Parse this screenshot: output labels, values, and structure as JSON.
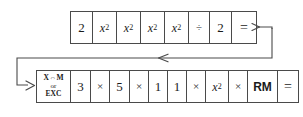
{
  "diagram": {
    "line_color": "#4a4a4a",
    "background_color": "#ffffff",
    "rows": [
      {
        "name": "top-sequence",
        "keys": [
          {
            "label": "2",
            "style": "num"
          },
          {
            "label": "x2",
            "style": "sq",
            "base": "x",
            "exp": "2"
          },
          {
            "label": "x2",
            "style": "sq",
            "base": "x",
            "exp": "2"
          },
          {
            "label": "x2",
            "style": "sq",
            "base": "x",
            "exp": "2"
          },
          {
            "label": "x2",
            "style": "sq",
            "base": "x",
            "exp": "2"
          },
          {
            "label": "÷",
            "style": "op"
          },
          {
            "label": "2",
            "style": "num"
          },
          {
            "label": "=",
            "style": "eq"
          }
        ]
      },
      {
        "name": "bottom-sequence",
        "keys": [
          {
            "label": "X⇔M or EXC",
            "style": "multiline",
            "line1": "X⇔M",
            "line2": "or",
            "line3": "EXC"
          },
          {
            "label": "3",
            "style": "num"
          },
          {
            "label": "×",
            "style": "op"
          },
          {
            "label": "5",
            "style": "num"
          },
          {
            "label": "×",
            "style": "op"
          },
          {
            "label": "1",
            "style": "num"
          },
          {
            "label": "1",
            "style": "num"
          },
          {
            "label": "×",
            "style": "op"
          },
          {
            "label": "x2",
            "style": "sq",
            "base": "x",
            "exp": "2"
          },
          {
            "label": "×",
            "style": "op"
          },
          {
            "label": "RM",
            "style": "bold"
          },
          {
            "label": "=",
            "style": "eq"
          }
        ]
      }
    ],
    "connector": {
      "name": "wrap-arrow",
      "description": "arrow leaving the = of the top row, running right, down, left across the page, then down and right into the first key of the bottom row",
      "arrowheads": [
        "right-after-equals",
        "left-midline",
        "right-into-bottom-row"
      ]
    }
  }
}
